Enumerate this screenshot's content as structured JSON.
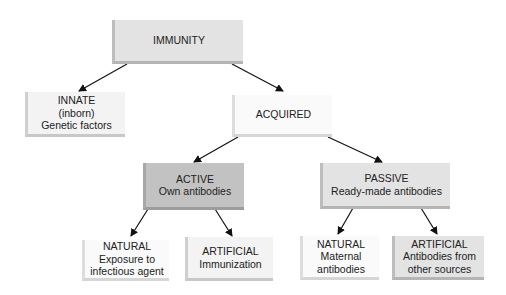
{
  "diagram": {
    "type": "hierarchy",
    "nodes": {
      "immunity": {
        "lines": [
          "IMMUNITY"
        ]
      },
      "innate": {
        "lines": [
          "INNATE",
          "(inborn)",
          "Genetic factors"
        ]
      },
      "acquired": {
        "lines": [
          "ACQUIRED"
        ]
      },
      "active": {
        "lines": [
          "ACTIVE",
          "Own antibodies"
        ]
      },
      "passive": {
        "lines": [
          "PASSIVE",
          "Ready-made antibodies"
        ]
      },
      "active_natural": {
        "lines": [
          "NATURAL",
          "Exposure to",
          "infectious agent"
        ]
      },
      "active_artificial": {
        "lines": [
          "ARTIFICIAL",
          "Immunization"
        ]
      },
      "passive_natural": {
        "lines": [
          "NATURAL",
          "Maternal",
          "antibodies"
        ]
      },
      "passive_artificial": {
        "lines": [
          "ARTIFICIAL",
          "Antibodies from",
          "other sources"
        ]
      }
    },
    "edges": [
      [
        "immunity",
        "innate"
      ],
      [
        "immunity",
        "acquired"
      ],
      [
        "acquired",
        "active"
      ],
      [
        "acquired",
        "passive"
      ],
      [
        "active",
        "active_natural"
      ],
      [
        "active",
        "active_artificial"
      ],
      [
        "passive",
        "passive_natural"
      ],
      [
        "passive",
        "passive_artificial"
      ]
    ]
  }
}
